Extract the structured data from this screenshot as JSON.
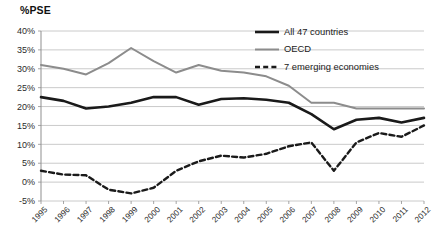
{
  "chart_data": {
    "type": "line",
    "title": "%PSE",
    "xlabel": "",
    "ylabel": "%PSE",
    "ylim": [
      -5,
      40
    ],
    "ytick_labels": [
      "40%",
      "35%",
      "30%",
      "25%",
      "20%",
      "15%",
      "10%",
      "5%",
      "0%",
      "-5%"
    ],
    "ytick_values": [
      40,
      35,
      30,
      25,
      20,
      15,
      10,
      5,
      0,
      -5
    ],
    "grid": true,
    "legend_position": "top-right",
    "categories": [
      "1995",
      "1996",
      "1997",
      "1998",
      "1999",
      "2000",
      "2001",
      "2002",
      "2003",
      "2004",
      "2005",
      "2006",
      "2007",
      "2008",
      "2009",
      "2010",
      "2011",
      "2012"
    ],
    "x": [
      1995,
      1996,
      1997,
      1998,
      1999,
      2000,
      2001,
      2002,
      2003,
      2004,
      2005,
      2006,
      2007,
      2008,
      2009,
      2010,
      2011,
      2012
    ],
    "series": [
      {
        "name": "All 47 countries",
        "style": "solid",
        "color": "#1a1a1a",
        "width": 2.6,
        "values": [
          22.5,
          21.5,
          19.5,
          20.0,
          21.0,
          22.5,
          22.5,
          20.5,
          22.0,
          22.2,
          21.8,
          21.0,
          18.0,
          14.0,
          16.5,
          17.0,
          15.8,
          17.0
        ]
      },
      {
        "name": "OECD",
        "style": "solid",
        "color": "#8c8c8c",
        "width": 2.0,
        "values": [
          31.0,
          30.0,
          28.5,
          31.5,
          35.5,
          32.0,
          29.0,
          31.0,
          29.5,
          29.0,
          28.0,
          25.5,
          21.0,
          21.0,
          19.5,
          19.5,
          19.5,
          19.5
        ]
      },
      {
        "name": "7 emerging economies",
        "style": "dashed",
        "color": "#1a1a1a",
        "width": 2.4,
        "values": [
          3.0,
          2.0,
          1.8,
          -2.0,
          -3.0,
          -1.5,
          3.0,
          5.5,
          7.0,
          6.5,
          7.5,
          9.5,
          10.5,
          3.0,
          10.5,
          13.0,
          12.0,
          15.0
        ]
      }
    ]
  },
  "legend": {
    "items": [
      {
        "label": "All 47 countries"
      },
      {
        "label": "OECD"
      },
      {
        "label": "7 emerging economies"
      }
    ]
  }
}
